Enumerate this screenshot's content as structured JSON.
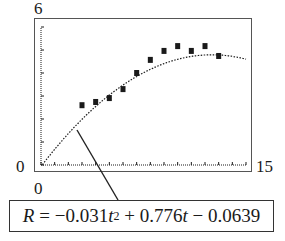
{
  "chart_data": {
    "type": "scatter",
    "title": "",
    "xlabel": "t",
    "ylabel": "R",
    "xlim": [
      0,
      15
    ],
    "ylim": [
      0,
      6
    ],
    "x_tick_labels": {
      "min": "0",
      "max": "15"
    },
    "y_tick_labels": {
      "min": "0",
      "max": "6"
    },
    "x_tick_step": 1,
    "y_tick_step": 1,
    "grid": false,
    "series": [
      {
        "name": "data",
        "type": "scatter",
        "marker": "square",
        "x": [
          3,
          4,
          5,
          6,
          7,
          8,
          9,
          10,
          11,
          12,
          13
        ],
        "y": [
          2.6,
          2.74,
          2.91,
          3.3,
          4.0,
          4.57,
          4.96,
          5.17,
          4.96,
          5.17,
          4.74
        ]
      },
      {
        "name": "model",
        "type": "line",
        "style": "dotted",
        "equation": {
          "a": -0.031,
          "b": 0.776,
          "c": -0.0639
        },
        "x_range": [
          0,
          15
        ]
      }
    ],
    "annotation": "R = −0.031t² + 0.776t − 0.0639"
  },
  "labels": {
    "y_max": "6",
    "y_min": "0",
    "x_min": "0",
    "x_max": "15"
  },
  "equation": {
    "var": "R",
    "eq": " = −0.031",
    "t1": "t",
    "exp": "2",
    "mid": " + 0.776",
    "t2": "t",
    "tail": " − 0.0639"
  },
  "colors": {
    "ink": "#1a1a1a",
    "frame": "#555555",
    "background": "#ffffff"
  }
}
